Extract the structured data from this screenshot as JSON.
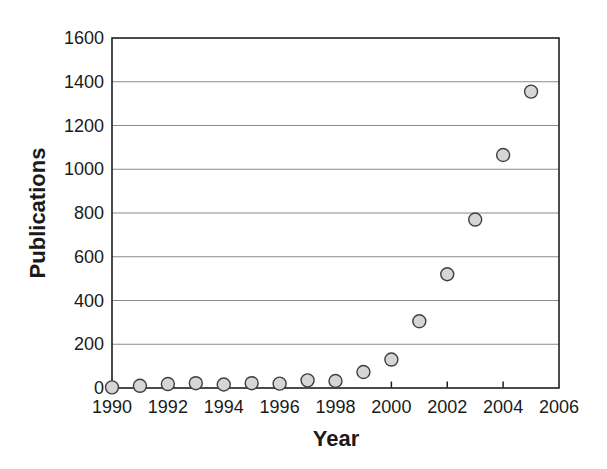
{
  "figure": {
    "background": "#ffffff"
  },
  "chart_data": {
    "type": "scatter",
    "title": "",
    "xlabel": "Year",
    "ylabel": "Publications",
    "x": [
      1990,
      1991,
      1992,
      1993,
      1994,
      1995,
      1996,
      1997,
      1998,
      1999,
      2000,
      2001,
      2002,
      2003,
      2004,
      2005
    ],
    "y": [
      3,
      10,
      18,
      22,
      16,
      22,
      20,
      35,
      32,
      73,
      130,
      305,
      520,
      770,
      1065,
      1355
    ],
    "xlim": [
      1990,
      2006
    ],
    "ylim": [
      0,
      1600
    ],
    "x_ticks": [
      1990,
      1992,
      1994,
      1996,
      1998,
      2000,
      2002,
      2004,
      2006
    ],
    "y_ticks": [
      0,
      200,
      400,
      600,
      800,
      1000,
      1200,
      1400,
      1600
    ],
    "grid": "horizontal",
    "legend": false,
    "marker": {
      "shape": "circle",
      "radius": 6.5,
      "fill": "#d6d6d6",
      "stroke": "#3f3f3f"
    },
    "colors": {
      "grid": "#8a8a8a",
      "axis": "#1f1f1f",
      "text": "#1a1a1a"
    }
  }
}
